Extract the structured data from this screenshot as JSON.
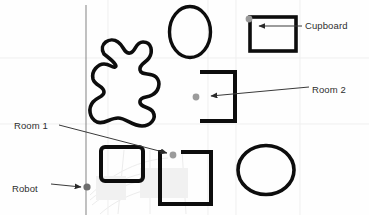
{
  "figure": {
    "name": "robot-environment-map",
    "background_color": "#fefefe",
    "width": 369,
    "height": 215
  },
  "labels": {
    "cupboard": "Cupboard",
    "room2": "Room 2",
    "room1": "Room 1",
    "robot_line1": "Robot",
    "robot_line2": "(origin)"
  },
  "colors": {
    "outline": "#0d0d0d",
    "text": "#2e2e2e",
    "leader": "#3a3a3a",
    "marker": "#9b9b9b",
    "origin_marker": "#6e6e6e",
    "axis": "#8d8d8d",
    "watermark": "#e9e9e9"
  },
  "shapes": [
    {
      "name": "vertical-axis-line",
      "type": "line",
      "x1": 86,
      "y1": 5,
      "x2": 86,
      "y2": 215
    },
    {
      "name": "blob-obstacle",
      "type": "blob",
      "cx": 122,
      "cy": 80
    },
    {
      "name": "ellipse-top",
      "type": "ellipse",
      "cx": 190,
      "cy": 32,
      "rx": 21,
      "ry": 26
    },
    {
      "name": "ellipse-bottom-right",
      "type": "ellipse",
      "cx": 266,
      "cy": 170,
      "rx": 28,
      "ry": 25
    },
    {
      "name": "cupboard-rect",
      "type": "rect",
      "x": 250,
      "y": 17,
      "w": 46,
      "h": 34
    },
    {
      "name": "room2-c-shape",
      "type": "polyline",
      "open_side": "left"
    },
    {
      "name": "room1-square",
      "type": "polyline",
      "open_side": "top-left"
    },
    {
      "name": "rounded-rect-left",
      "type": "rect",
      "x": 101,
      "y": 147,
      "w": 42,
      "h": 34
    }
  ],
  "markers": [
    {
      "name": "cupboard-marker",
      "x": 249,
      "y": 19,
      "r": 3.4,
      "color": "#9b9b9b"
    },
    {
      "name": "room2-marker",
      "x": 196,
      "y": 97,
      "r": 3.4,
      "color": "#9b9b9b"
    },
    {
      "name": "room1-marker",
      "x": 173,
      "y": 155,
      "r": 3.4,
      "color": "#9b9b9b"
    },
    {
      "name": "robot-origin-marker",
      "x": 87,
      "y": 187,
      "r": 3.4,
      "color": "#6e6e6e"
    }
  ],
  "leader_lines": [
    {
      "name": "cupboard-leader",
      "from_label": "Cupboard",
      "x1": 302,
      "y1": 26,
      "x2": 258,
      "y2": 26
    },
    {
      "name": "room2-leader",
      "from_label": "Room 2",
      "x1": 309,
      "y1": 88,
      "x2": 210,
      "y2": 96
    },
    {
      "name": "room1-leader",
      "from_label": "Room 1",
      "x1": 60,
      "y1": 125,
      "x2": 166,
      "y2": 153
    },
    {
      "name": "robot-leader",
      "from_label": "Robot (origin)",
      "x1": 52,
      "y1": 184,
      "x2": 82,
      "y2": 187
    }
  ]
}
